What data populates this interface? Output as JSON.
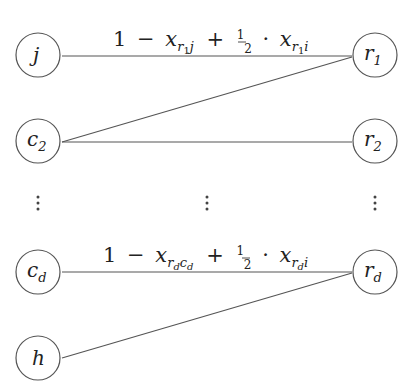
{
  "diagram": {
    "type": "bipartite-graph",
    "left_nodes": [
      {
        "id": "j",
        "base": "j",
        "sub": "",
        "cx": 38,
        "cy": 55
      },
      {
        "id": "c2",
        "base": "c",
        "sub": "2",
        "cx": 38,
        "cy": 141
      },
      {
        "id": "cd",
        "base": "c",
        "sub": "d",
        "cx": 38,
        "cy": 272
      },
      {
        "id": "h",
        "base": "h",
        "sub": "",
        "cx": 38,
        "cy": 358
      }
    ],
    "right_nodes": [
      {
        "id": "r1",
        "base": "r",
        "sub": "1",
        "cx": 375,
        "cy": 55
      },
      {
        "id": "r2",
        "base": "r",
        "sub": "2",
        "cx": 375,
        "cy": 141
      },
      {
        "id": "rd",
        "base": "r",
        "sub": "d",
        "cx": 375,
        "cy": 272
      }
    ],
    "edges": [
      {
        "from": "j",
        "to": "r1",
        "label": "1 − x_{r1 j} + ½ · x_{r1 i}"
      },
      {
        "from": "c2",
        "to": "r1",
        "label": ""
      },
      {
        "from": "c2",
        "to": "r2",
        "label": ""
      },
      {
        "from": "cd",
        "to": "rd",
        "label": "1 − x_{rd cd} + ½ · x_{rd i}"
      },
      {
        "from": "h",
        "to": "rd",
        "label": ""
      }
    ],
    "ellipsis": "⋮",
    "edge_labels": {
      "top": {
        "one": "1",
        "minus": "−",
        "x1": "x",
        "x1_sub_r": "r",
        "x1_sub_r_sub": "1",
        "x1_sub_tail": "j",
        "plus": "+",
        "frac_num": "1",
        "frac_den": "2",
        "cdot": "·",
        "x2": "x",
        "x2_sub_r": "r",
        "x2_sub_r_sub": "1",
        "x2_sub_tail": "i"
      },
      "bottom": {
        "one": "1",
        "minus": "−",
        "x1": "x",
        "x1_sub_r": "r",
        "x1_sub_r_sub": "d",
        "x1_sub_c": "c",
        "x1_sub_c_sub": "d",
        "plus": "+",
        "frac_num": "1",
        "frac_den": "2",
        "cdot": "·",
        "x2": "x",
        "x2_sub_r": "r",
        "x2_sub_r_sub": "d",
        "x2_sub_tail": "i"
      }
    },
    "labels": {
      "j": {
        "base": "j"
      },
      "c2": {
        "base": "c",
        "sub": "2"
      },
      "cd": {
        "base": "c",
        "sub": "d"
      },
      "h": {
        "base": "h"
      },
      "r1": {
        "base": "r",
        "sub": "1"
      },
      "r2": {
        "base": "r",
        "sub": "2"
      },
      "rd": {
        "base": "r",
        "sub": "d"
      }
    }
  }
}
